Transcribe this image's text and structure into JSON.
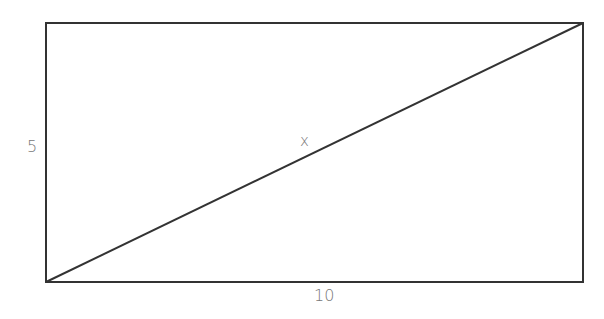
{
  "diagram": {
    "shape": "rectangle with diagonal",
    "labels": {
      "height": "5",
      "width": "10",
      "diagonal": "x"
    },
    "colors": {
      "stroke": "#333333",
      "label": "#777777"
    }
  }
}
